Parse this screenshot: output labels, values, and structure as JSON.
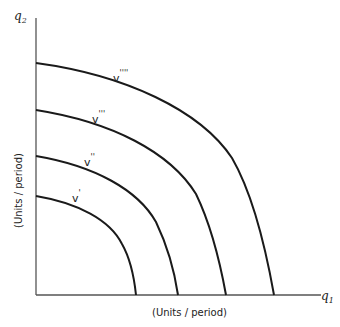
{
  "diagram": {
    "axes": {
      "y_label": "q",
      "y_label_sub": "2",
      "x_label": "q",
      "x_label_sub": "1",
      "y_units": "(Units / period)",
      "x_units": "(Units / period)"
    },
    "curves": [
      {
        "label": "v",
        "primes": "'",
        "y_intercept_px": 196,
        "x_intercept_px": 136
      },
      {
        "label": "v",
        "primes": "''",
        "y_intercept_px": 156,
        "x_intercept_px": 178
      },
      {
        "label": "v",
        "primes": "'''",
        "y_intercept_px": 110,
        "x_intercept_px": 226
      },
      {
        "label": "v",
        "primes": "''''",
        "y_intercept_px": 63,
        "x_intercept_px": 274
      }
    ],
    "colors": {
      "line": "#1a1a1a",
      "axis": "#555555",
      "background": "#ffffff"
    }
  }
}
